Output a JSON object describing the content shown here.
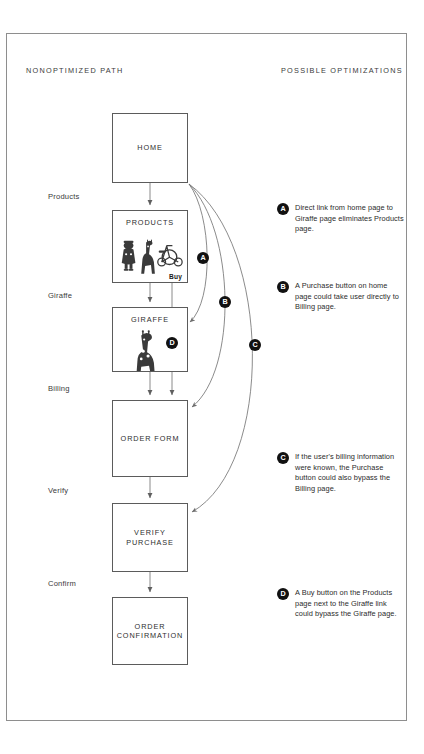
{
  "diagram": {
    "headers": {
      "left": "NONOPTIMIZED PATH",
      "right": "POSSIBLE OPTIMIZATIONS"
    },
    "stage_labels": [
      {
        "text": "Products",
        "top": 192
      },
      {
        "text": "Giraffe",
        "top": 291
      },
      {
        "text": "Billing",
        "top": 384
      },
      {
        "text": "Verify",
        "top": 486
      },
      {
        "text": "Confirm",
        "top": 579
      }
    ],
    "nodes": [
      {
        "id": "home",
        "title": "HOME",
        "top": 113,
        "height": 70,
        "thumb": "none",
        "buy": ""
      },
      {
        "id": "products",
        "title": "PRODUCTS",
        "top": 210,
        "height": 73,
        "thumb": "products",
        "buy": "Buy"
      },
      {
        "id": "giraffe",
        "title": "GIRAFFE",
        "top": 307,
        "height": 65,
        "thumb": "giraffe",
        "buy": ""
      },
      {
        "id": "orderform",
        "title": "ORDER FORM",
        "top": 400,
        "height": 77,
        "thumb": "none",
        "buy": ""
      },
      {
        "id": "verify",
        "title": "VERIFY\nPURCHASE",
        "top": 503,
        "height": 69,
        "thumb": "none",
        "buy": ""
      },
      {
        "id": "confirmation",
        "title": "ORDER\nCONFIRMATION",
        "top": 597,
        "height": 68,
        "thumb": "none",
        "buy": ""
      }
    ],
    "curve_markers": [
      {
        "letter": "A",
        "left": 197,
        "top": 252
      },
      {
        "letter": "B",
        "left": 219,
        "top": 296
      },
      {
        "letter": "C",
        "left": 249,
        "top": 339
      },
      {
        "letter": "D",
        "left": 166,
        "top": 337
      }
    ],
    "notes": [
      {
        "letter": "A",
        "top": 203,
        "text": "Direct link from home page to Giraffe page eliminates Products page."
      },
      {
        "letter": "B",
        "top": 281,
        "text": "A Purchase button on home page could take user directly to Billing page."
      },
      {
        "letter": "C",
        "top": 452,
        "text": "If the user's billing information were known, the Purchase button could also bypass the Billing page."
      },
      {
        "letter": "D",
        "top": 588,
        "text": "A Buy button on the Products page next to the Giraffe link could bypass the Giraffe page."
      }
    ],
    "colors": {
      "frame": "#8e8e8e",
      "node_border": "#5b5b5b",
      "line": "#6d6d6d",
      "marker_fill": "#111111",
      "text": "#2b2b2b",
      "page": "#ffffff"
    }
  }
}
